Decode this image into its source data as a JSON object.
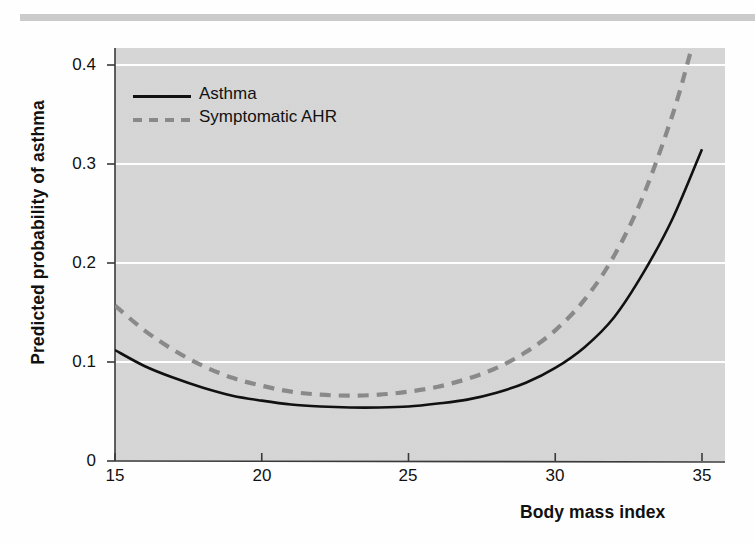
{
  "figure": {
    "background_color": "#ffffff",
    "panel_color": "#d6d6d6",
    "top_rule_color": "#c9c9c9"
  },
  "chart_data": {
    "type": "line",
    "title": "",
    "subtitle": "",
    "xlabel": "Body mass index",
    "ylabel": "Predicted probability of asthma",
    "xlim": [
      15,
      35
    ],
    "ylim": [
      0,
      0.42
    ],
    "xticks": [
      15,
      20,
      25,
      30,
      35
    ],
    "xtick_labels": [
      "15",
      "20",
      "25",
      "30",
      "35"
    ],
    "yticks": [
      0,
      0.1,
      0.2,
      0.3,
      0.4
    ],
    "ytick_labels": [
      "0",
      "0.1",
      "0.2",
      "0.3",
      "0.4"
    ],
    "grid": "horizontal-white-gridlines",
    "gridline_color": "#ffffff",
    "legend_position": "upper-left-inside",
    "series": [
      {
        "name": "Asthma",
        "color": "#111111",
        "linestyle": "solid",
        "x": [
          15,
          16,
          17,
          18,
          19,
          20,
          21,
          22,
          23,
          24,
          25,
          26,
          27,
          28,
          29,
          30,
          31,
          32,
          33,
          34,
          35
        ],
        "values": [
          0.112,
          0.096,
          0.084,
          0.074,
          0.066,
          0.061,
          0.057,
          0.055,
          0.054,
          0.054,
          0.055,
          0.058,
          0.062,
          0.069,
          0.079,
          0.094,
          0.115,
          0.145,
          0.19,
          0.245,
          0.315
        ]
      },
      {
        "name": "Symptomatic AHR",
        "color": "#8a8a8a",
        "linestyle": "dashed",
        "x": [
          15,
          16,
          17,
          18,
          19,
          20,
          21,
          22,
          23,
          24,
          25,
          26,
          27,
          28,
          29,
          30,
          31,
          32,
          33,
          34,
          34.6
        ],
        "values": [
          0.157,
          0.132,
          0.112,
          0.096,
          0.084,
          0.076,
          0.07,
          0.067,
          0.066,
          0.067,
          0.07,
          0.075,
          0.083,
          0.094,
          0.11,
          0.132,
          0.163,
          0.207,
          0.268,
          0.35,
          0.412
        ]
      }
    ],
    "annotations": []
  },
  "legend": {
    "items": [
      {
        "label": "Asthma",
        "style": "solid",
        "color": "#111111"
      },
      {
        "label": "Symptomatic AHR",
        "style": "dashed",
        "color": "#8a8a8a"
      }
    ]
  },
  "axis_titles": {
    "y": "Predicted probability of asthma",
    "x": "Body mass index"
  },
  "tick_labels": {
    "y": [
      "0.4",
      "0.3",
      "0.2",
      "0.1",
      "0"
    ],
    "x": [
      "15",
      "20",
      "25",
      "30",
      "35"
    ]
  }
}
